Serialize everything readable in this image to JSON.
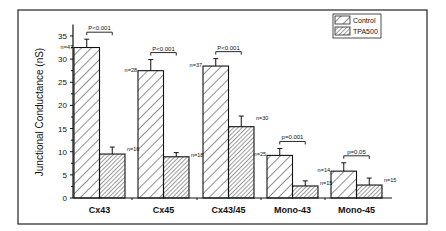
{
  "chart_data": {
    "type": "bar",
    "title": "",
    "xlabel": "",
    "ylabel": "Junctional Conductance (nS)",
    "ylim": [
      0,
      37
    ],
    "yticks": [
      0,
      5,
      10,
      15,
      20,
      25,
      30,
      35
    ],
    "categories": [
      "Cx43",
      "Cx45",
      "Cx43/45",
      "Mono-43",
      "Mono-45"
    ],
    "series": [
      {
        "name": "Control",
        "values": [
          32.5,
          27.5,
          28.5,
          9.2,
          5.8
        ],
        "errors": [
          1.8,
          2.4,
          1.6,
          1.5,
          1.8
        ],
        "n": [
          "n=47",
          "n=28",
          "n=37",
          "n=25",
          "n=14"
        ]
      },
      {
        "name": "TPA500",
        "values": [
          9.5,
          8.9,
          15.4,
          2.6,
          2.8
        ],
        "errors": [
          1.5,
          0.9,
          2.3,
          1.1,
          1.5
        ],
        "n": [
          "n=16",
          "n=18",
          "n=30",
          "n=15",
          "n=15"
        ]
      }
    ],
    "annotations": [
      "P<0.001",
      "P<0.001",
      "P<0.001",
      "p=0.001",
      "p=0.05"
    ],
    "legend_position": "top-right",
    "grid": false
  },
  "legend": {
    "items": [
      "Control",
      "TPA500"
    ]
  }
}
